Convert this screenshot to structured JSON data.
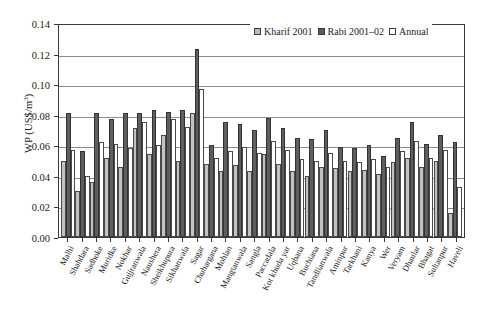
{
  "chart_data": {
    "type": "bar",
    "title": "",
    "xlabel": "",
    "ylabel": "WP (US$/m3)",
    "ylabel_parts": {
      "main": "WP (US$/m",
      "sup": "3",
      "tail": ")"
    },
    "ylim": [
      0,
      0.14
    ],
    "ytick_step": 0.02,
    "yticks": [
      "0.00",
      "0.02",
      "0.04",
      "0.06",
      "0.08",
      "0.10",
      "0.12",
      "0.14"
    ],
    "grid": true,
    "legend_position": "top-right",
    "categories": [
      "Malhi",
      "Shahdara",
      "Sadhoke",
      "Muridke",
      "Nokhar",
      "Gujjranwala",
      "Naushera",
      "Sheikhupura",
      "Sikhanwala",
      "Sagar",
      "Chuhargana",
      "Mohlan",
      "Mangtanwala",
      "Sangla",
      "Paccadala",
      "Kot khuda yar",
      "Uqbana",
      "Buchiana",
      "Tandlianwala",
      "Aminpur",
      "Tarkhani",
      "Kanya",
      "Wer",
      "Veryam",
      "Dhaular",
      "Bhagat",
      "Sultanpur",
      "Haveli"
    ],
    "series": [
      {
        "name": "Kharif 2001",
        "color": "#c2c2c2",
        "values": [
          0.05,
          0.03,
          0.036,
          0.052,
          0.046,
          0.071,
          0.054,
          0.067,
          0.05,
          0.081,
          0.048,
          0.043,
          0.047,
          0.043,
          0.054,
          0.048,
          0.043,
          0.04,
          0.046,
          0.045,
          0.043,
          0.044,
          0.041,
          0.049,
          0.052,
          0.046,
          0.05,
          0.016
        ]
      },
      {
        "name": "Rabi 2001-02",
        "color": "#5e5e5e",
        "values": [
          0.081,
          0.056,
          0.081,
          0.077,
          0.081,
          0.081,
          0.083,
          0.082,
          0.083,
          0.123,
          0.06,
          0.075,
          0.074,
          0.07,
          0.078,
          0.071,
          0.065,
          0.064,
          0.07,
          0.059,
          0.058,
          0.06,
          0.053,
          0.065,
          0.075,
          0.061,
          0.067,
          0.062
        ]
      },
      {
        "name": "Annual",
        "color": "#ffffff",
        "values": [
          0.057,
          0.04,
          0.062,
          0.061,
          0.058,
          0.075,
          0.06,
          0.077,
          0.072,
          0.097,
          0.052,
          0.056,
          0.059,
          0.055,
          0.063,
          0.057,
          0.051,
          0.05,
          0.055,
          0.05,
          0.049,
          0.051,
          0.046,
          0.056,
          0.063,
          0.052,
          0.057,
          0.033
        ]
      }
    ]
  },
  "legend": {
    "items": [
      {
        "label": "Kharif 2001"
      },
      {
        "label": "Rabi 2001–02"
      },
      {
        "label": "Annual"
      }
    ]
  }
}
